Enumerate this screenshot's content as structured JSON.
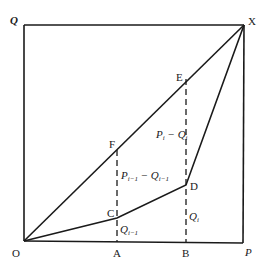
{
  "diagram": {
    "corner_labels": {
      "origin": "O",
      "top_left": "Q",
      "top_right": "X",
      "bottom_right": "P"
    },
    "point_labels": {
      "E": "E",
      "F": "F",
      "C": "C",
      "D": "D",
      "A": "A",
      "B": "B"
    },
    "segment_labels": {
      "upper_right": {
        "main": "P",
        "main_sub": "i",
        "minus": " − ",
        "second": "Q",
        "second_sub": "i"
      },
      "upper_left": {
        "main": "P",
        "main_sub": "i−1",
        "minus": " − ",
        "second": "Q",
        "second_sub": "i−1"
      },
      "lower_right": {
        "main": "Q",
        "main_sub": "i"
      },
      "lower_left": {
        "main": "Q",
        "main_sub": "i−1"
      }
    }
  }
}
